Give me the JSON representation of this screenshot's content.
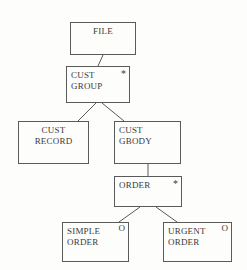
{
  "diagram": {
    "type": "jsp-structure-tree",
    "title": "",
    "colors": {
      "background": "#fdfdfc",
      "stroke": "#5a5a5a",
      "text": "#3a3a3a"
    },
    "nodes": [
      {
        "id": "file",
        "label": "FILE",
        "marker": "",
        "x": 70,
        "y": 22,
        "w": 66,
        "h": 33,
        "align": "center"
      },
      {
        "id": "cust-group",
        "label": "CUST\nGROUP",
        "marker": "*",
        "x": 66,
        "y": 66,
        "w": 64,
        "h": 37,
        "align": "left"
      },
      {
        "id": "cust-record",
        "label": "CUST\nRECORD",
        "marker": "",
        "x": 18,
        "y": 121,
        "w": 71,
        "h": 43,
        "align": "center"
      },
      {
        "id": "cust-gbody",
        "label": "CUST\nGBODY",
        "marker": "",
        "x": 114,
        "y": 121,
        "w": 67,
        "h": 43,
        "align": "left"
      },
      {
        "id": "order",
        "label": "ORDER",
        "marker": "*",
        "x": 114,
        "y": 176,
        "w": 68,
        "h": 31,
        "align": "left"
      },
      {
        "id": "simple-order",
        "label": "SIMPLE\nORDER",
        "marker": "O",
        "x": 62,
        "y": 222,
        "w": 67,
        "h": 40,
        "align": "left"
      },
      {
        "id": "urgent-order",
        "label": "URGENT\nORDER",
        "marker": "O",
        "x": 163,
        "y": 222,
        "w": 69,
        "h": 40,
        "align": "left"
      }
    ],
    "edges": [
      {
        "id": "file-to-cust-group",
        "from": "file",
        "to": "cust-group",
        "x1": 103,
        "y1": 55,
        "x2": 98,
        "y2": 66
      },
      {
        "id": "cust-group-to-cust-record",
        "from": "cust-group",
        "to": "cust-record",
        "x1": 96,
        "y1": 103,
        "x2": 78,
        "y2": 121
      },
      {
        "id": "cust-group-to-cust-gbody",
        "from": "cust-group",
        "to": "cust-gbody",
        "x1": 102,
        "y1": 103,
        "x2": 124,
        "y2": 121
      },
      {
        "id": "cust-gbody-to-order",
        "from": "cust-gbody",
        "to": "order",
        "x1": 148,
        "y1": 164,
        "x2": 148,
        "y2": 176
      },
      {
        "id": "order-to-simple-order",
        "from": "order",
        "to": "simple-order",
        "x1": 140,
        "y1": 207,
        "x2": 119,
        "y2": 222
      },
      {
        "id": "order-to-urgent-order",
        "from": "order",
        "to": "urgent-order",
        "x1": 156,
        "y1": 207,
        "x2": 177,
        "y2": 222
      }
    ],
    "legend": {
      "star_meaning": "*",
      "circle_meaning": "O"
    }
  }
}
